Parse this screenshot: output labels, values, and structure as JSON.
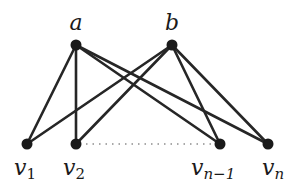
{
  "diagram": {
    "type": "bipartite-graph",
    "colors": {
      "edge": "#262626",
      "node": "#1a1a1a",
      "dots": "#555555",
      "background": "#ffffff"
    },
    "top_nodes": [
      {
        "id": "a",
        "label": "a",
        "x": 76,
        "y": 45
      },
      {
        "id": "b",
        "label": "b",
        "x": 172,
        "y": 45
      }
    ],
    "bottom_nodes": [
      {
        "id": "v1",
        "label": "v",
        "sub": "1",
        "x": 27,
        "y": 144
      },
      {
        "id": "v2",
        "label": "v",
        "sub": "2",
        "x": 76,
        "y": 144
      },
      {
        "id": "vn-1",
        "label": "v",
        "sub": "n−1",
        "x": 220,
        "y": 144
      },
      {
        "id": "vn",
        "label": "v",
        "sub": "n",
        "x": 268,
        "y": 144
      }
    ],
    "edges": [
      [
        "a",
        "v1"
      ],
      [
        "a",
        "v2"
      ],
      [
        "a",
        "vn-1"
      ],
      [
        "a",
        "vn"
      ],
      [
        "b",
        "v1"
      ],
      [
        "b",
        "v2"
      ],
      [
        "b",
        "vn-1"
      ],
      [
        "b",
        "vn"
      ]
    ],
    "ellipsis": {
      "from": "v2",
      "to": "vn-1",
      "style": "dotted"
    }
  }
}
